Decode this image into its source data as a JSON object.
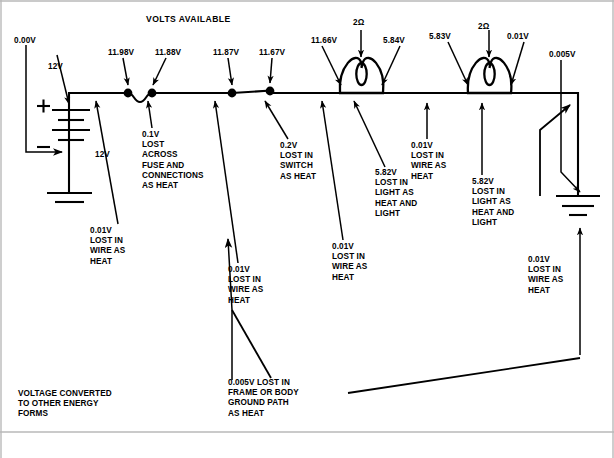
{
  "diagram": {
    "title": "VOLTS AVAILABLE",
    "kind": "automotive-series-lighting-circuit-voltage-drop"
  },
  "source_voltage": {
    "top_label": "12V",
    "side_label": "12V"
  },
  "node_voltages": [
    {
      "id": "ground-start",
      "text": "0.00V"
    },
    {
      "id": "battery-positive",
      "text": "12V"
    },
    {
      "id": "after-wire-1",
      "text": "11.98V"
    },
    {
      "id": "after-fuse",
      "text": "11.88V"
    },
    {
      "id": "before-switch",
      "text": "11.87V"
    },
    {
      "id": "after-switch",
      "text": "11.67V"
    },
    {
      "id": "lamp1-in",
      "text": "11.66V"
    },
    {
      "id": "lamp1-out",
      "text": "5.84V"
    },
    {
      "id": "lamp2-in",
      "text": "5.83V"
    },
    {
      "id": "lamp2-out",
      "text": "0.01V"
    },
    {
      "id": "chassis-ground",
      "text": "0.005V"
    }
  ],
  "component_values": [
    {
      "id": "lamp-1-resistance",
      "text": "2Ω"
    },
    {
      "id": "lamp-2-resistance",
      "text": "2Ω"
    }
  ],
  "drop_labels": [
    {
      "id": "drop-wire-battery",
      "lines": [
        "0.01V",
        "LOST IN",
        "WIRE AS",
        "HEAT"
      ]
    },
    {
      "id": "drop-fuse",
      "lines": [
        "0.1V",
        "LOST",
        "ACROSS",
        "FUSE AND",
        "CONNECTIONS",
        "AS HEAT"
      ]
    },
    {
      "id": "drop-wire-before-switch",
      "lines": [
        "0.01V",
        "LOST IN",
        "WIRE AS",
        "HEAT"
      ]
    },
    {
      "id": "drop-switch",
      "lines": [
        "0.2V",
        "LOST IN",
        "SWITCH",
        "AS HEAT"
      ]
    },
    {
      "id": "drop-wire-to-lamp1",
      "lines": [
        "0.01V",
        "LOST IN",
        "WIRE AS",
        "HEAT"
      ]
    },
    {
      "id": "drop-lamp1",
      "lines": [
        "5.82V",
        "LOST IN",
        "LIGHT AS",
        "HEAT AND",
        "LIGHT"
      ]
    },
    {
      "id": "drop-wire-between-lamps",
      "lines": [
        "0.01V",
        "LOST IN",
        "WIRE AS",
        "HEAT"
      ]
    },
    {
      "id": "drop-lamp2",
      "lines": [
        "5.82V",
        "LOST IN",
        "LIGHT AS",
        "HEAT AND",
        "LIGHT"
      ]
    },
    {
      "id": "drop-wire-to-ground",
      "lines": [
        "0.01V",
        "LOST IN",
        "WIRE AS",
        "HEAT"
      ]
    },
    {
      "id": "drop-frame-ground",
      "lines": [
        "0.005V LOST IN",
        "FRAME OR BODY",
        "GROUND PATH",
        "AS HEAT"
      ]
    },
    {
      "id": "energy-conversion-note",
      "lines": [
        "VOLTAGE CONVERTED",
        "TO OTHER ENERGY",
        "FORMS"
      ]
    }
  ],
  "colors": {
    "ink": "#000000",
    "paper": "#ffffff",
    "frame": "#b9b9b9"
  }
}
